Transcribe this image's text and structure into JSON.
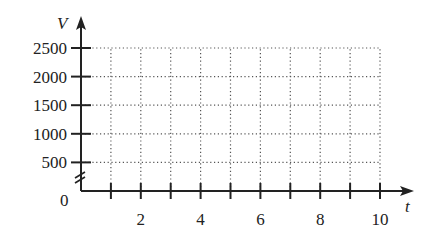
{
  "chart_data": {
    "type": "line",
    "title": "",
    "xlabel": "t",
    "ylabel": "V",
    "xlim": [
      0,
      10
    ],
    "ylim": [
      0,
      2500
    ],
    "x_ticks": [
      1,
      2,
      3,
      4,
      5,
      6,
      7,
      8,
      9,
      10
    ],
    "x_tick_labels": [
      "2",
      "4",
      "6",
      "8",
      "10"
    ],
    "x_tick_label_values": [
      2,
      4,
      6,
      8,
      10
    ],
    "y_ticks": [
      500,
      1000,
      1500,
      2000,
      2500
    ],
    "y_tick_labels": [
      "2500",
      "2000",
      "1500",
      "1000",
      "500"
    ],
    "origin_label": "0",
    "grid": true,
    "grid_style": "dotted",
    "y_axis_break": true,
    "series": []
  },
  "colors": {
    "axis": "#222222",
    "grid": "#555555",
    "text": "#222222"
  }
}
